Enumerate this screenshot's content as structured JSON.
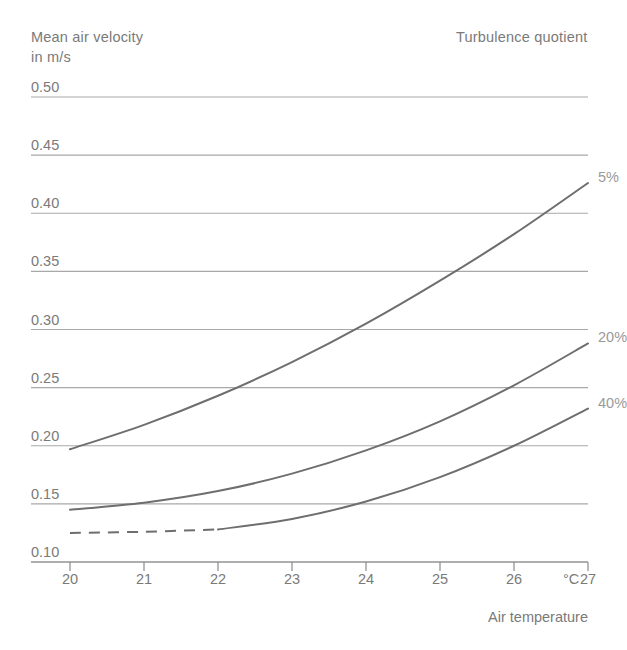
{
  "axis_titles": {
    "y_line1": "Mean air velocity",
    "y_line2": "in m/s",
    "turbulence": "Turbulence quotient",
    "x": "Air temperature",
    "x_unit": "°C"
  },
  "chart_data": {
    "type": "line",
    "title": "",
    "subtitle": "",
    "xlabel": "Air temperature",
    "ylabel": "Mean air velocity in m/s",
    "xunit": "°C",
    "yunit": "m/s",
    "legend_title": "Turbulence quotient",
    "legend_position": "inline-right-of-curve-ends",
    "grid": true,
    "grid_axis": "y",
    "xlim": [
      20,
      27
    ],
    "ylim": [
      0.1,
      0.5
    ],
    "xticks": [
      20,
      21,
      22,
      23,
      24,
      25,
      26,
      27
    ],
    "xtick_labels": [
      "20",
      "21",
      "22",
      "23",
      "24",
      "25",
      "26",
      "27"
    ],
    "yticks": [
      0.1,
      0.15,
      0.2,
      0.25,
      0.3,
      0.35,
      0.4,
      0.45,
      0.5
    ],
    "ytick_labels": [
      "0.10",
      "0.15",
      "0.20",
      "0.25",
      "0.30",
      "0.35",
      "0.40",
      "0.45",
      "0.50"
    ],
    "x": [
      20,
      21,
      22,
      23,
      24,
      25,
      26,
      27
    ],
    "series": [
      {
        "name": "5%",
        "label": "5%",
        "color": "#6e6e6e",
        "style": "solid",
        "values": [
          0.197,
          0.218,
          0.243,
          0.272,
          0.305,
          0.342,
          0.382,
          0.426
        ]
      },
      {
        "name": "20%",
        "label": "20%",
        "color": "#6e6e6e",
        "style": "solid",
        "values": [
          0.145,
          0.151,
          0.161,
          0.176,
          0.196,
          0.221,
          0.252,
          0.288
        ]
      },
      {
        "name": "40%",
        "label": "40%",
        "color": "#6e6e6e",
        "style": "dashed-then-solid",
        "dashed_until_x": 22,
        "values": [
          0.125,
          0.126,
          0.128,
          0.137,
          0.152,
          0.173,
          0.2,
          0.232
        ]
      }
    ]
  },
  "colors": {
    "curve": "#6e6e6e",
    "gridline": "#a8a8a8",
    "axis": "#8a8a8a",
    "text": "#7a7a7a",
    "series_label": "#9a9a9a",
    "background": "#ffffff"
  }
}
